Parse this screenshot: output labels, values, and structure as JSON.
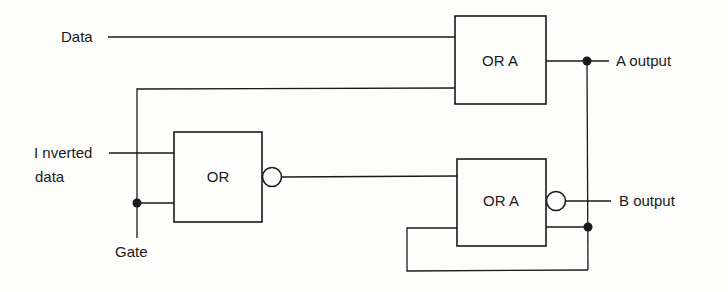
{
  "diagram": {
    "type": "logic-circuit",
    "inputs": {
      "data": "Data",
      "inverted_data_line1": "I nverted",
      "inverted_data_line2": "data",
      "gate": "Gate"
    },
    "gates": [
      {
        "id": "or-a-top",
        "label": "OR A",
        "inverted_output": false
      },
      {
        "id": "or-left",
        "label": "OR",
        "inverted_output": true
      },
      {
        "id": "or-a-bottom",
        "label": "OR A",
        "inverted_output": true
      }
    ],
    "outputs": {
      "a": "A output",
      "b": "B output"
    },
    "colors": {
      "ink": "#1a1a1a",
      "background": "#fdfdfc"
    }
  }
}
